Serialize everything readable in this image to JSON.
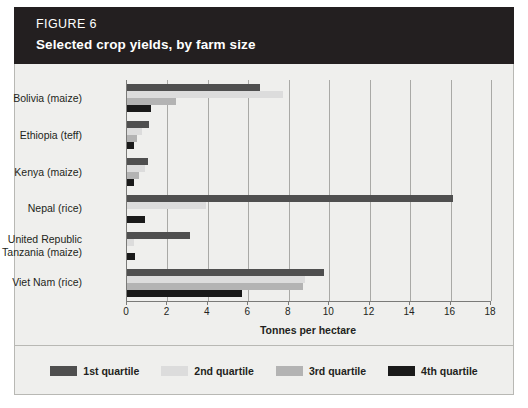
{
  "banner": {
    "figure_number": "FIGURE 6",
    "title": "Selected crop yields, by farm size",
    "background_color": "#231f20",
    "text_color": "#ffffff"
  },
  "chart_data": {
    "type": "bar",
    "orientation": "horizontal",
    "title": "Selected crop yields, by farm size",
    "xlabel": "Tonnes per hectare",
    "ylabel": "",
    "xlim": [
      0,
      18
    ],
    "xticks": [
      0,
      2,
      4,
      6,
      8,
      10,
      12,
      14,
      16,
      18
    ],
    "xticklabels": [
      "0",
      "2",
      "4",
      "6",
      "8",
      "10",
      "12",
      "14",
      "16",
      "18"
    ],
    "grid": true,
    "grid_axis": "x",
    "legend_position": "bottom",
    "categories": [
      "Bolivia (maize)",
      "Ethiopia (teff)",
      "Kenya (maize)",
      "Nepal (rice)",
      "United Republic of Tanzania (maize)",
      "Viet Nam (rice)"
    ],
    "series": [
      {
        "name": "1st quartile",
        "color": "#4f4f4f",
        "values": [
          6.6,
          1.1,
          1.05,
          16.1,
          3.1,
          9.75
        ]
      },
      {
        "name": "2nd quartile",
        "color": "#dcdcdc",
        "values": [
          7.7,
          0.75,
          0.9,
          3.9,
          0.35,
          8.8
        ]
      },
      {
        "name": "3rd quartile",
        "color": "#b3b3b3",
        "values": [
          2.4,
          0.5,
          0.6,
          0.0,
          0.0,
          8.7
        ]
      },
      {
        "name": "4th quartile",
        "color": "#1a1a1a",
        "values": [
          1.2,
          0.35,
          0.35,
          0.9,
          0.4,
          5.7
        ]
      }
    ]
  },
  "legend": {
    "items": [
      {
        "label": "1st quartile",
        "color": "#4f4f4f"
      },
      {
        "label": "2nd quartile",
        "color": "#dcdcdc"
      },
      {
        "label": "3rd quartile",
        "color": "#b3b3b3"
      },
      {
        "label": "4th quartile",
        "color": "#1a1a1a"
      }
    ]
  }
}
